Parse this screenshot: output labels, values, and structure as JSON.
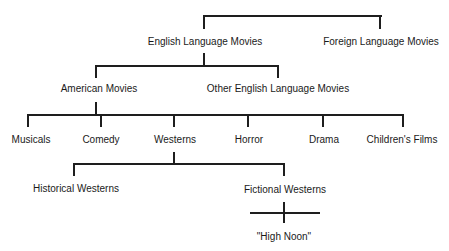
{
  "diagram": {
    "type": "tree",
    "root_children": [
      "English Language Movies",
      "Foreign Language Movies"
    ],
    "nodes": {
      "english": "English Language Movies",
      "foreign": "Foreign Language Movies",
      "american": "American Movies",
      "other_english": "Other English Language Movies",
      "musicals": "Musicals",
      "comedy": "Comedy",
      "westerns": "Westerns",
      "horror": "Horror",
      "drama": "Drama",
      "childrens": "Children's Films",
      "historical": "Historical Westerns",
      "fictional": "Fictional Westerns",
      "high_noon": "\"High Noon\""
    },
    "edges": [
      [
        "(root)",
        "English Language Movies"
      ],
      [
        "(root)",
        "Foreign Language Movies"
      ],
      [
        "English Language Movies",
        "American Movies"
      ],
      [
        "English Language Movies",
        "Other English Language Movies"
      ],
      [
        "American Movies",
        "Musicals"
      ],
      [
        "American Movies",
        "Comedy"
      ],
      [
        "American Movies",
        "Westerns"
      ],
      [
        "American Movies",
        "Horror"
      ],
      [
        "American Movies",
        "Drama"
      ],
      [
        "American Movies",
        "Children's Films"
      ],
      [
        "Westerns",
        "Historical Westerns"
      ],
      [
        "Westerns",
        "Fictional Westerns"
      ],
      [
        "Fictional Westerns",
        "\"High Noon\""
      ]
    ]
  }
}
